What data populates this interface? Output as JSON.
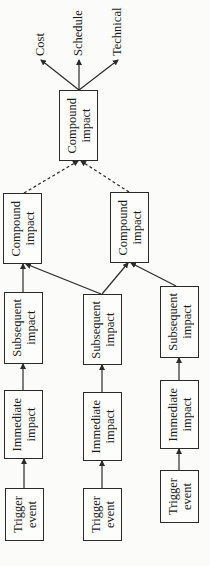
{
  "diagram": {
    "type": "risk-impact-propagation-flow",
    "orientation": "rotated-90-ccw",
    "outcomes": [
      {
        "label": "Cost"
      },
      {
        "label": "Schedule"
      },
      {
        "label": "Technical"
      }
    ],
    "final_node": {
      "label": "Compound\nimpact"
    },
    "compound_nodes": [
      {
        "label": "Compound\nimpact"
      },
      {
        "label": "Compound\nimpact"
      }
    ],
    "chains": [
      {
        "trigger": "Trigger\nevent",
        "immediate": "Immediate\nimpact",
        "subsequent": "Subsequent\nimpact"
      },
      {
        "trigger": "Trigger\nevent",
        "immediate": "Immediate\nimpact",
        "subsequent": "Subsequent\nimpact"
      },
      {
        "trigger": "Trigger\nevent",
        "immediate": "Immediate\nimpact",
        "subsequent": "Subsequent\nimpact"
      }
    ],
    "edges": [
      {
        "from": "chain1.trigger",
        "to": "chain1.immediate",
        "style": "solid"
      },
      {
        "from": "chain1.immediate",
        "to": "chain1.subsequent",
        "style": "solid"
      },
      {
        "from": "chain1.subsequent",
        "to": "compound1",
        "style": "solid"
      },
      {
        "from": "chain2.trigger",
        "to": "chain2.immediate",
        "style": "solid"
      },
      {
        "from": "chain2.immediate",
        "to": "chain2.subsequent",
        "style": "solid"
      },
      {
        "from": "chain2.subsequent",
        "to": "compound1",
        "style": "solid"
      },
      {
        "from": "chain2.subsequent",
        "to": "compound2",
        "style": "solid"
      },
      {
        "from": "chain3.trigger",
        "to": "chain3.immediate",
        "style": "solid"
      },
      {
        "from": "chain3.immediate",
        "to": "chain3.subsequent",
        "style": "solid"
      },
      {
        "from": "chain3.subsequent",
        "to": "compound2",
        "style": "solid"
      },
      {
        "from": "compound1",
        "to": "final",
        "style": "dashed"
      },
      {
        "from": "compound2",
        "to": "final",
        "style": "dashed"
      },
      {
        "from": "final",
        "to": "Cost",
        "style": "solid"
      },
      {
        "from": "final",
        "to": "Schedule",
        "style": "solid"
      },
      {
        "from": "final",
        "to": "Technical",
        "style": "solid"
      }
    ],
    "colors": {
      "line": "#2a2a2a",
      "background": "#fbfbf9"
    }
  }
}
